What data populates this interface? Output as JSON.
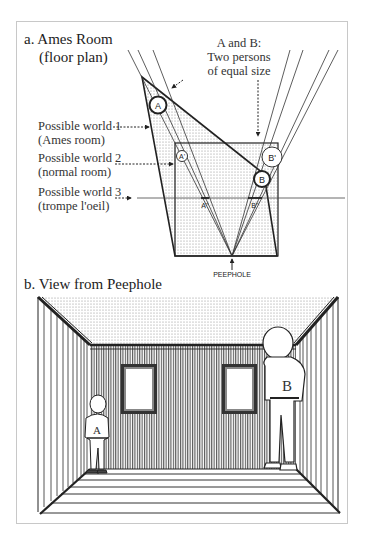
{
  "panel_a": {
    "title_line1": "a.  Ames Room",
    "title_line2": "(floor plan)",
    "note_line1": "A and B:",
    "note_line2": "Two persons",
    "note_line3": "of equal size",
    "worlds": [
      {
        "line1": "Possible world 1",
        "line2": "(Ames room)"
      },
      {
        "line1": "Possible world 2",
        "line2": "(normal room)"
      },
      {
        "line1": "Possible world 3",
        "line2": "(trompe l'oeil)"
      }
    ],
    "markers": {
      "a": "A",
      "b": "B",
      "a_prime": "A'",
      "b_prime": "B'",
      "a_dprime": "A''",
      "b_dprime": "B''"
    },
    "peephole_label": "PEEPHOLE"
  },
  "panel_b": {
    "title": "b.  View from Peephole",
    "person_small_label": "A",
    "person_large_label": "B"
  },
  "colors": {
    "ink": "#222222",
    "stipple": "#d9d9d9",
    "frame": "#c8c8c8"
  }
}
